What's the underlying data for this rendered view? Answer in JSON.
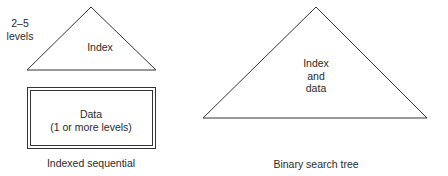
{
  "left": {
    "levels_label": [
      "2–5",
      "levels"
    ],
    "index_label": "Index",
    "data_label": [
      "Data",
      "(1 or more levels)"
    ],
    "caption": "Indexed sequential"
  },
  "right": {
    "tree_label": [
      "Index",
      "and",
      "data"
    ],
    "caption": "Binary search tree"
  }
}
